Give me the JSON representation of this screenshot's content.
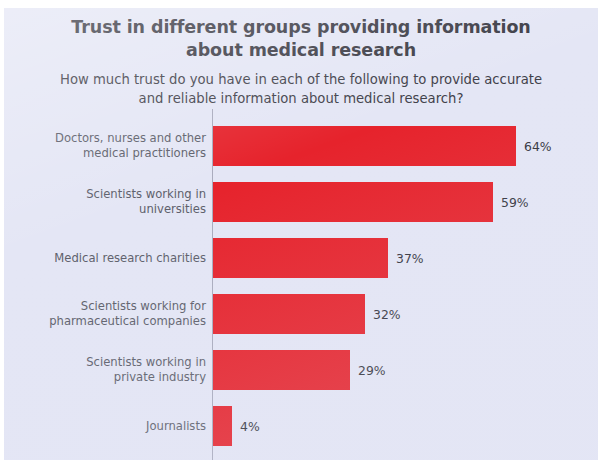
{
  "title": {
    "line1": "Trust in different groups providing information",
    "line2": "about medical research"
  },
  "subtitle": {
    "line1": "How much trust do you have in each of the following to provide accurate",
    "line2": "and reliable information about medical research?"
  },
  "colors": {
    "bar": "#e6232c",
    "background": "#e4e6f5",
    "title_text": "#3b3b45",
    "category_text": "#5d5f6b",
    "value_text": "#33343d",
    "axis_line": "#a9abbd"
  },
  "chart_data": {
    "type": "bar",
    "orientation": "horizontal",
    "title": "Trust in different groups providing information about medical research",
    "subtitle": "How much trust do you have in each of the following to provide accurate and reliable information about medical research?",
    "xlabel": "",
    "ylabel": "",
    "xlim": [
      0,
      70
    ],
    "grid": false,
    "legend": false,
    "value_suffix": "%",
    "categories": [
      "Doctors, nurses and other medical practitioners",
      "Scientists working in universities",
      "Medical research charities",
      "Scientists working for pharmaceutical companies",
      "Scientists working in private industry",
      "Journalists"
    ],
    "values": [
      64,
      59,
      37,
      32,
      29,
      4
    ],
    "value_labels": [
      "64%",
      "59%",
      "37%",
      "32%",
      "29%",
      "4%"
    ]
  },
  "bars": [
    {
      "label_line1": "Doctors, nurses and other",
      "label_line2": "medical practitioners",
      "value": 64,
      "value_label": "64%"
    },
    {
      "label_line1": "Scientists working in",
      "label_line2": "universities",
      "value": 59,
      "value_label": "59%"
    },
    {
      "label_line1": "Medical research charities",
      "label_line2": "",
      "value": 37,
      "value_label": "37%"
    },
    {
      "label_line1": "Scientists working for",
      "label_line2": "pharmaceutical companies",
      "value": 32,
      "value_label": "32%"
    },
    {
      "label_line1": "Scientists working in",
      "label_line2": "private industry",
      "value": 29,
      "value_label": "29%"
    },
    {
      "label_line1": "Journalists",
      "label_line2": "",
      "value": 4,
      "value_label": "4%"
    }
  ]
}
